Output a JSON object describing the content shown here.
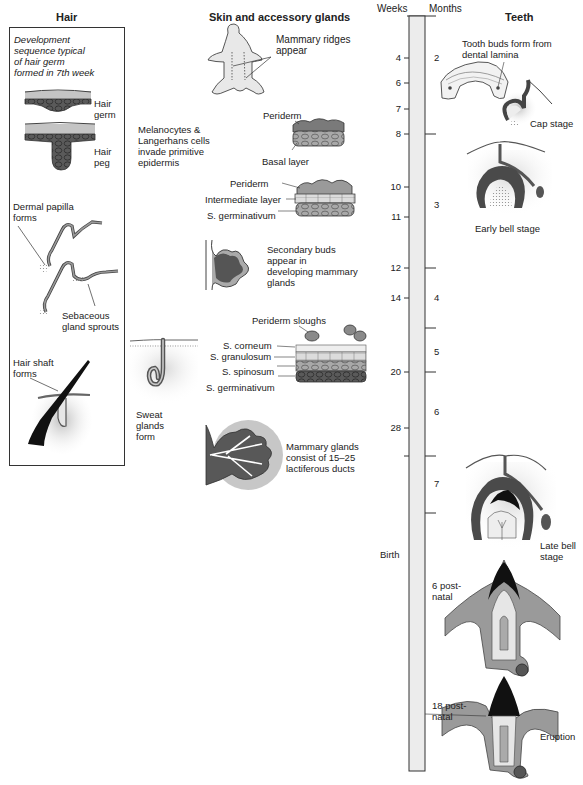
{
  "headers": {
    "hair": "Hair",
    "skin": "Skin and accessory glands",
    "weeks": "Weeks",
    "months": "Months",
    "teeth": "Teeth"
  },
  "hair_panel": {
    "intro": [
      "Development",
      "sequence typical",
      "of hair germ",
      "formed in 7th week"
    ],
    "hair_germ": [
      "Hair",
      "germ"
    ],
    "hair_peg": [
      "Hair",
      "peg"
    ],
    "dermal_papilla": [
      "Dermal papilla",
      "forms"
    ],
    "sebaceous": [
      "Sebaceous",
      "gland sprouts"
    ],
    "hair_shaft": [
      "Hair shaft",
      "forms"
    ]
  },
  "skin_panel": {
    "mammary_ridges": [
      "Mammary ridges",
      "appear"
    ],
    "melanocytes": [
      "Melanocytes &",
      "Langerhans cells",
      "invade primitive",
      "epidermis"
    ],
    "periderm_1": "Periderm",
    "basal_layer": "Basal layer",
    "periderm_2": "Periderm",
    "intermediate_layer": "Intermediate layer",
    "s_germinativum_1": "S. germinativum",
    "secondary_buds": [
      "Secondary buds",
      "appear in",
      "developing mammary",
      "glands"
    ],
    "periderm_sloughs": "Periderm sloughs",
    "s_corneum": "S. corneum",
    "s_granulosum": "S. granulosum",
    "s_spinosum": "S. spinosum",
    "s_germinativum_2": "S. germinativum",
    "sweat_glands": [
      "Sweat",
      "glands",
      "form"
    ],
    "mammary_glands": [
      "Mammary glands",
      "consist of 15–25",
      "lactiferous ducts"
    ]
  },
  "timeline": {
    "weeks": [
      "4",
      "6",
      "7",
      "8",
      "10",
      "11",
      "12",
      "14",
      "20",
      "28"
    ],
    "months": [
      "2",
      "3",
      "4",
      "5",
      "6",
      "7"
    ],
    "birth": "Birth",
    "post6": [
      "6 post-",
      "natal"
    ],
    "post18": [
      "18 post-",
      "natal"
    ]
  },
  "teeth_panel": {
    "tooth_buds": [
      "Tooth buds form from",
      "dental lamina"
    ],
    "cap_stage": "Cap stage",
    "early_bell": "Early bell stage",
    "late_bell": [
      "Late bell",
      "stage"
    ],
    "eruption": "Eruption"
  },
  "colors": {
    "tissue_dark": "#4a4a4a",
    "tissue_mid": "#8c8c8c",
    "tissue_light": "#c8c8c8",
    "timeline_fill": "#ececec",
    "enamel": "#111111"
  }
}
